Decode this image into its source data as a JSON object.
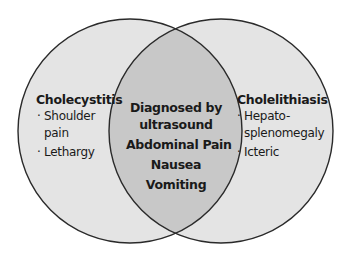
{
  "diagram": {
    "type": "venn",
    "colors": {
      "circle_fill": "#e4e4e4",
      "overlap_fill": "#c8c8c8",
      "stroke": "#2a2a2a",
      "background": "#ffffff"
    },
    "left": {
      "title": "Cholecystitis",
      "items": [
        {
          "bullet": "·",
          "lines": [
            "Shoulder",
            "pain"
          ]
        },
        {
          "bullet": "·",
          "lines": [
            "Lethargy"
          ]
        }
      ]
    },
    "right": {
      "title": "Cholelithiasis",
      "items": [
        {
          "bullet": "·",
          "lines": [
            "Hepato-",
            "splenomegaly"
          ]
        },
        {
          "bullet": "·",
          "lines": [
            "Icteric"
          ]
        }
      ]
    },
    "overlap": {
      "lines": [
        "Diagnosed by",
        "ultrasound",
        "Abdominal Pain",
        "Nausea",
        "Vomiting"
      ]
    }
  }
}
